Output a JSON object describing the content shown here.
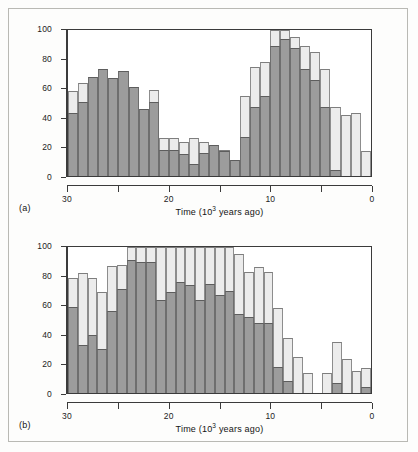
{
  "figure": {
    "background_color": "#fdfdfc",
    "dark_series_color": "#9c9c9c",
    "light_series_color": "#ececec",
    "axis_color": "#3b3b3b"
  },
  "panels": [
    {
      "tag": "(a)",
      "axis_title_prefix": "Time (10",
      "axis_title_exponent": "3",
      "axis_title_suffix": " years ago)"
    },
    {
      "tag": "(b)",
      "axis_title_prefix": "Time (10",
      "axis_title_exponent": "3",
      "axis_title_suffix": " years ago)"
    }
  ],
  "chart_data": [
    {
      "type": "bar",
      "panel": "(a)",
      "title": "",
      "xlabel": "Time (10^3 years ago)",
      "ylabel": "",
      "xlim": [
        30,
        0
      ],
      "ylim": [
        0,
        100
      ],
      "x_ticks": [
        30,
        25,
        20,
        15,
        10,
        5,
        0
      ],
      "x_tick_labels": [
        "30",
        "",
        "20",
        "",
        "10",
        "",
        "0"
      ],
      "y_ticks": [
        0,
        20,
        40,
        60,
        80,
        100
      ],
      "y_tick_labels": [
        "0",
        "20",
        "40",
        "60",
        "80",
        "100"
      ],
      "grid": false,
      "legend": "none",
      "bin_width": 1,
      "orientation": "stacked-overlay",
      "x_bin_centers": [
        29.5,
        28.5,
        27.5,
        26.5,
        25.5,
        24.5,
        23.5,
        22.5,
        21.5,
        20.5,
        19.5,
        18.5,
        17.5,
        16.5,
        15.5,
        14.5,
        13.5,
        12.5,
        11.5,
        10.5,
        9.5,
        8.5,
        7.5,
        6.5,
        5.5,
        4.5,
        3.5,
        2.5,
        1.5,
        0.5
      ],
      "series": [
        {
          "name": "light",
          "color": "#ececec",
          "values": [
            58,
            64,
            68,
            73,
            67,
            72,
            61,
            46,
            59,
            26,
            26,
            23,
            26,
            23,
            21,
            18,
            11,
            55,
            75,
            78,
            100,
            100,
            95,
            89,
            85,
            73,
            47,
            42,
            43,
            17
          ]
        },
        {
          "name": "dark",
          "color": "#9c9c9c",
          "values": [
            43,
            51,
            68,
            73,
            67,
            72,
            61,
            46,
            51,
            18,
            18,
            15,
            8,
            16,
            21,
            17,
            11,
            27,
            47,
            55,
            89,
            94,
            88,
            73,
            66,
            47,
            4,
            0,
            0,
            0
          ]
        }
      ]
    },
    {
      "type": "bar",
      "panel": "(b)",
      "title": "",
      "xlabel": "Time (10^3 years ago)",
      "ylabel": "",
      "xlim": [
        30,
        0
      ],
      "ylim": [
        0,
        100
      ],
      "x_ticks": [
        30,
        25,
        20,
        15,
        10,
        5,
        0
      ],
      "x_tick_labels": [
        "30",
        "",
        "20",
        "",
        "10",
        "",
        "0"
      ],
      "y_ticks": [
        0,
        20,
        40,
        60,
        80,
        100
      ],
      "y_tick_labels": [
        "0",
        "20",
        "40",
        "60",
        "80",
        "100"
      ],
      "grid": false,
      "legend": "none",
      "bin_width": 1,
      "orientation": "stacked-overlay",
      "x_bin_centers": [
        29.5,
        28.5,
        27.5,
        26.5,
        25.5,
        24.5,
        23.5,
        22.5,
        21.5,
        20.5,
        19.5,
        18.5,
        17.5,
        16.5,
        15.5,
        14.5,
        13.5,
        12.5,
        11.5,
        10.5,
        9.5,
        8.5,
        7.5,
        6.5,
        5.5,
        4.5,
        3.5,
        2.5,
        1.5,
        0.5
      ],
      "series": [
        {
          "name": "light",
          "color": "#ececec",
          "values": [
            79,
            82,
            79,
            69,
            87,
            88,
            100,
            100,
            100,
            100,
            100,
            100,
            100,
            100,
            100,
            100,
            100,
            95,
            83,
            86,
            83,
            58,
            38,
            25,
            14,
            0,
            14,
            35,
            23,
            15,
            17
          ]
        },
        {
          "name": "dark",
          "color": "#9c9c9c",
          "values": [
            59,
            33,
            40,
            30,
            56,
            71,
            91,
            90,
            90,
            64,
            69,
            76,
            74,
            64,
            75,
            67,
            70,
            54,
            52,
            48,
            48,
            18,
            8,
            0,
            0,
            0,
            0,
            7,
            0,
            0,
            4
          ]
        }
      ]
    }
  ]
}
